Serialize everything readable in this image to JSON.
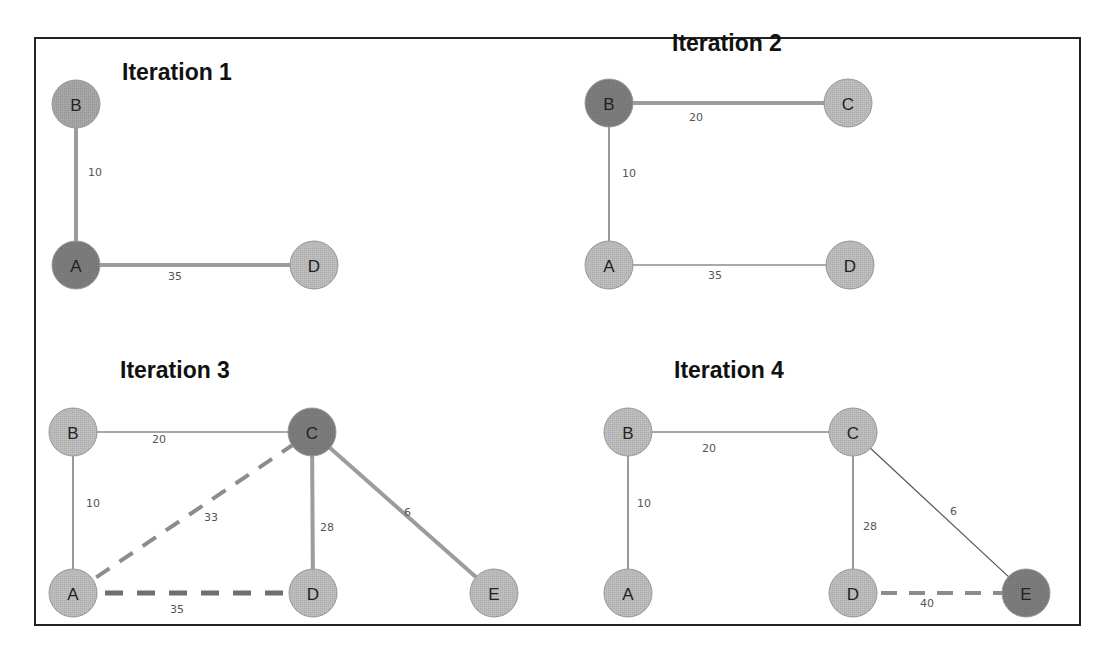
{
  "colors": {
    "node_default": "#bdbdbd",
    "node_active": "#7d7d7d",
    "node_stroke": "#9a9a9a",
    "edge_thin": "#555555",
    "edge_thick": "#9c9c9c",
    "edge_dashed": "#8c8c8c",
    "edge_dashed_dark": "#707070",
    "frame": "#222222"
  },
  "panels": [
    {
      "title": "Iteration 1",
      "title_pos": [
        122,
        63
      ],
      "nodes": [
        {
          "id": "B",
          "x": 76,
          "y": 104,
          "state": "default_mid"
        },
        {
          "id": "A",
          "x": 76,
          "y": 265,
          "state": "active"
        },
        {
          "id": "D",
          "x": 314,
          "y": 265,
          "state": "default"
        }
      ],
      "edges": [
        {
          "from": "B",
          "to": "A",
          "weight": "10",
          "style": "thick",
          "label_pos": [
            88,
            176
          ]
        },
        {
          "from": "A",
          "to": "D",
          "weight": "35",
          "style": "thick",
          "label_pos": [
            168,
            280
          ]
        }
      ]
    },
    {
      "title": "Iteration 2",
      "title_pos": [
        672,
        34
      ],
      "nodes": [
        {
          "id": "B",
          "x": 609,
          "y": 103,
          "state": "active"
        },
        {
          "id": "C",
          "x": 848,
          "y": 103,
          "state": "default"
        },
        {
          "id": "A",
          "x": 609,
          "y": 265,
          "state": "default"
        },
        {
          "id": "D",
          "x": 850,
          "y": 265,
          "state": "default"
        }
      ],
      "edges": [
        {
          "from": "B",
          "to": "C",
          "weight": "20",
          "style": "thick",
          "label_pos": [
            689,
            121
          ]
        },
        {
          "from": "B",
          "to": "A",
          "weight": "10",
          "style": "thin",
          "label_pos": [
            622,
            177
          ]
        },
        {
          "from": "A",
          "to": "D",
          "weight": "35",
          "style": "thin",
          "label_pos": [
            708,
            279
          ]
        }
      ]
    },
    {
      "title": "Iteration 3",
      "title_pos": [
        120,
        361
      ],
      "nodes": [
        {
          "id": "B",
          "x": 73,
          "y": 432,
          "state": "default"
        },
        {
          "id": "C",
          "x": 312,
          "y": 432,
          "state": "active"
        },
        {
          "id": "A",
          "x": 73,
          "y": 593,
          "state": "default"
        },
        {
          "id": "D",
          "x": 313,
          "y": 593,
          "state": "default"
        },
        {
          "id": "E",
          "x": 494,
          "y": 593,
          "state": "default"
        }
      ],
      "edges": [
        {
          "from": "B",
          "to": "C",
          "weight": "20",
          "style": "thin_light",
          "label_pos": [
            152,
            443
          ]
        },
        {
          "from": "B",
          "to": "A",
          "weight": "10",
          "style": "thin",
          "label_pos": [
            86,
            507
          ]
        },
        {
          "from": "A",
          "to": "C",
          "weight": "33",
          "style": "dashed",
          "label_pos": [
            204,
            521
          ]
        },
        {
          "from": "C",
          "to": "D",
          "weight": "28",
          "style": "thick",
          "label_pos": [
            320,
            531
          ]
        },
        {
          "from": "C",
          "to": "E",
          "weight": "6",
          "style": "thick",
          "label_pos": [
            404,
            516
          ]
        },
        {
          "from": "A",
          "to": "D",
          "weight": "35",
          "style": "dashed_dark",
          "label_pos": [
            170,
            613
          ]
        }
      ]
    },
    {
      "title": "Iteration 4",
      "title_pos": [
        674,
        361
      ],
      "nodes": [
        {
          "id": "B",
          "x": 628,
          "y": 432,
          "state": "default"
        },
        {
          "id": "C",
          "x": 853,
          "y": 432,
          "state": "default"
        },
        {
          "id": "A",
          "x": 628,
          "y": 593,
          "state": "default"
        },
        {
          "id": "D",
          "x": 853,
          "y": 593,
          "state": "default"
        },
        {
          "id": "E",
          "x": 1026,
          "y": 593,
          "state": "active"
        }
      ],
      "edges": [
        {
          "from": "B",
          "to": "C",
          "weight": "20",
          "style": "thin_light",
          "label_pos": [
            702,
            452
          ]
        },
        {
          "from": "B",
          "to": "A",
          "weight": "10",
          "style": "thin",
          "label_pos": [
            637,
            507
          ]
        },
        {
          "from": "C",
          "to": "D",
          "weight": "28",
          "style": "thin",
          "label_pos": [
            863,
            530
          ]
        },
        {
          "from": "C",
          "to": "E",
          "weight": "6",
          "style": "thin",
          "label_pos": [
            950,
            515
          ]
        },
        {
          "from": "D",
          "to": "E",
          "weight": "40",
          "style": "dashed",
          "label_pos": [
            920,
            607
          ]
        }
      ]
    }
  ]
}
